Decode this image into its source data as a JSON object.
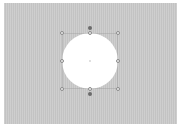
{
  "canvas": {
    "background_color": "#c9c9c9",
    "page_color": "#ffffff"
  },
  "selected_shape": {
    "type": "circle",
    "fill_color": "#ffffff",
    "selected": true,
    "handles": [
      "top-left",
      "top",
      "top-right",
      "left",
      "right",
      "bottom-left",
      "bottom",
      "bottom-right"
    ],
    "rotation_handles": [
      "top",
      "bottom"
    ]
  }
}
